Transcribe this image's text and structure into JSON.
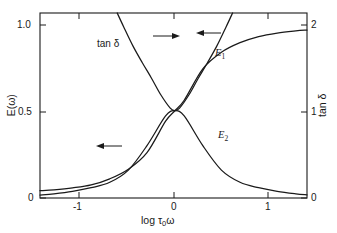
{
  "chart_data": {
    "type": "line",
    "title": "",
    "xlabel": "log τ0ω",
    "xlabel_parts": {
      "pre": "log ",
      "tau": "τ",
      "sub": "0",
      "omega": "ω"
    },
    "ylabel_left": "E(ω)",
    "ylabel_right": "tan δ",
    "xlim": [
      -1.45,
      1.42
    ],
    "ylim_left": [
      0,
      1.06
    ],
    "ylim_right": [
      0,
      2.12
    ],
    "grid": false,
    "legend": "inline-labels",
    "xticks": [
      -1,
      0,
      1
    ],
    "xticklabels": [
      "-1",
      "0",
      "1"
    ],
    "yticks_left": [
      0,
      0.5,
      1.0
    ],
    "yticklabels_left": [
      "0",
      "0.5",
      "1.0"
    ],
    "yticks_right": [
      0,
      1,
      2
    ],
    "yticklabels_right": [
      "0",
      "1",
      "2"
    ],
    "series": [
      {
        "name": "E1",
        "label": "E",
        "sub": "1",
        "axis": "left",
        "arrow": "left",
        "x": [
          -1.45,
          -1.3,
          -1.1,
          -0.9,
          -0.7,
          -0.5,
          -0.3,
          -0.1,
          0,
          0.1,
          0.3,
          0.5,
          0.7,
          0.9,
          1.1,
          1.3,
          1.42
        ],
        "values": [
          0.042,
          0.047,
          0.058,
          0.075,
          0.11,
          0.165,
          0.26,
          0.44,
          0.5,
          0.56,
          0.74,
          0.835,
          0.89,
          0.925,
          0.945,
          0.957,
          0.962
        ]
      },
      {
        "name": "E2",
        "label": "E",
        "sub": "2",
        "axis": "left",
        "arrow": "left",
        "x": [
          -1.45,
          -1.3,
          -1.1,
          -0.9,
          -0.7,
          -0.5,
          -0.3,
          -0.1,
          0,
          0.1,
          0.3,
          0.5,
          0.7,
          0.9,
          1.1,
          1.3,
          1.42
        ],
        "values": [
          0.017,
          0.024,
          0.038,
          0.059,
          0.09,
          0.16,
          0.3,
          0.47,
          0.5,
          0.47,
          0.3,
          0.16,
          0.09,
          0.059,
          0.038,
          0.024,
          0.018
        ]
      },
      {
        "name": "tan-delta",
        "label": "tan δ",
        "axis": "right",
        "arrow": "right",
        "x": [
          -0.62,
          -0.55,
          -0.45,
          -0.35,
          -0.25,
          -0.15,
          -0.05,
          0,
          0.05,
          0.15,
          0.25,
          0.35,
          0.45,
          0.55,
          0.62
        ],
        "values": [
          2.12,
          1.96,
          1.74,
          1.55,
          1.37,
          1.18,
          1.03,
          1.0,
          1.03,
          1.18,
          1.37,
          1.55,
          1.74,
          1.96,
          2.12
        ]
      }
    ],
    "annotations": [
      {
        "name": "tan-delta-label",
        "text": "tan δ"
      },
      {
        "name": "tan-delta-arrow",
        "direction": "right"
      },
      {
        "name": "e1-arrow",
        "direction": "left"
      },
      {
        "name": "e2-arrow",
        "direction": "left"
      }
    ],
    "colors": {
      "axis": "#1a1a1a",
      "curve": "#1a1a1a",
      "background": "#ffffff"
    }
  }
}
